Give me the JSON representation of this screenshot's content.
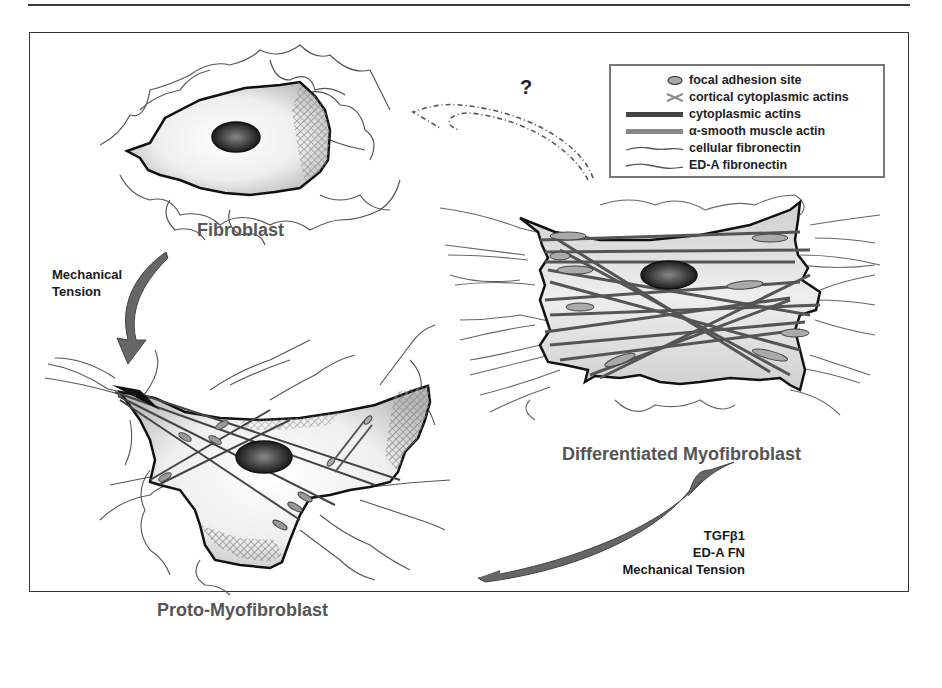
{
  "figure": {
    "cells": {
      "fibroblast": {
        "label": "Fibroblast"
      },
      "proto_myofibroblast": {
        "label": "Proto-Myofibroblast"
      },
      "differentiated_myofibroblast": {
        "label": "Differentiated Myofibroblast"
      }
    },
    "transitions": {
      "fibroblast_to_proto": {
        "label_line1": "Mechanical",
        "label_line2": "Tension"
      },
      "proto_to_differentiated": {
        "line1": "TGFβ1",
        "line2": "ED-A FN",
        "line3": "Mechanical Tension"
      },
      "reversal": {
        "label": "?"
      }
    },
    "legend": {
      "items": [
        {
          "symbol": "focal-adhesion-ellipse",
          "label": "focal adhesion site"
        },
        {
          "symbol": "cortical-cross",
          "label": "cortical cytoplasmic actins"
        },
        {
          "symbol": "thick-dark-bar",
          "label": "cytoplasmic actins"
        },
        {
          "symbol": "thick-gray-bar",
          "label": "α-smooth muscle actin"
        },
        {
          "symbol": "wavy-line",
          "label": "cellular fibronectin"
        },
        {
          "symbol": "wavy-line",
          "label": "ED-A fibronectin"
        }
      ]
    },
    "colors": {
      "outline": "#111111",
      "cell_fill": "#d8d8d8",
      "nucleus": "#2a2a2a",
      "fiber": "#555555",
      "arrow": "#666666",
      "label_gray": "#555555"
    }
  }
}
